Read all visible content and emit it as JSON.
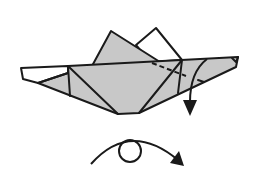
{
  "diagram": {
    "type": "origami-step",
    "colors": {
      "paper_colored": "#c8c8c8",
      "paper_white": "#ffffff",
      "line": "#1a1a1a"
    },
    "symbols": [
      {
        "name": "valley-fold-line",
        "style": "dashed"
      },
      {
        "name": "fold-arrow",
        "direction": "down"
      },
      {
        "name": "turn-over-symbol",
        "direction": "right"
      }
    ]
  }
}
